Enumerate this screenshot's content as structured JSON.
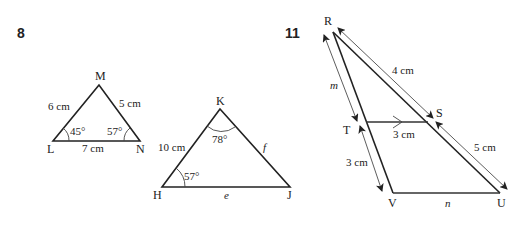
{
  "problems": [
    {
      "number": "8",
      "triangles": [
        {
          "name": "LMN",
          "vertices": {
            "top": "M",
            "left": "L",
            "right": "N"
          },
          "sides": {
            "LM": "6 cm",
            "MN": "5 cm",
            "LN": "7 cm"
          },
          "angles": {
            "L": "45°",
            "N": "57°"
          }
        },
        {
          "name": "HKJ",
          "vertices": {
            "top": "K",
            "left": "H",
            "right": "J"
          },
          "sides": {
            "HK": "10 cm",
            "KJ": "f",
            "HJ": "e"
          },
          "angles": {
            "K": "78°",
            "H": "57°"
          }
        }
      ]
    },
    {
      "number": "11",
      "figure": {
        "vertices": {
          "R": "R",
          "S": "S",
          "T": "T",
          "V": "V",
          "U": "U"
        },
        "labels": {
          "RS": "4 cm",
          "SU": "5 cm",
          "TS": "3 cm",
          "TV": "3 cm",
          "RT": "m",
          "VU": "n"
        }
      }
    }
  ]
}
